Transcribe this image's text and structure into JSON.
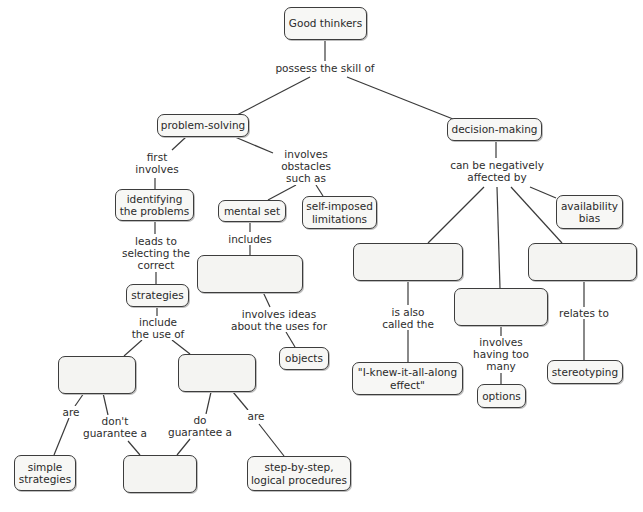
{
  "diagram": {
    "type": "concept-map",
    "nodes": {
      "root": "Good thinkers",
      "problem_solving": "problem-solving",
      "decision_making": "decision-making",
      "identifying": "identifying\nthe problems",
      "mental_set": "mental set",
      "self_imposed": "self-imposed\nlimitations",
      "blank_mental_child": "",
      "strategies": "strategies",
      "objects": "objects",
      "blank_strategy_left": "",
      "blank_strategy_right": "",
      "simple_strategies": "simple\nstrategies",
      "blank_solution": "",
      "step_by_step": "step-by-step,\nlogical procedures",
      "availability_bias": "availability\nbias",
      "blank_decision_left": "",
      "blank_decision_middle": "",
      "blank_decision_right": "",
      "i_knew": "\"I-knew-it-all-along\neffect\"",
      "options": "options",
      "stereotyping": "stereotyping"
    },
    "links": {
      "possess": "possess the skill of",
      "first_involves": "first\ninvolves",
      "obstacles": "involves\nobstacles\nsuch as",
      "leads_to": "leads to\nselecting the\ncorrect",
      "includes": "includes",
      "ideas": "involves ideas\nabout the uses for",
      "include_use": "include\nthe use of",
      "are_left": "are",
      "dont_guarantee": "don't\nguarantee a",
      "do_guarantee": "do\nguarantee a",
      "are_right": "are",
      "negatively": "can be negatively\naffected by",
      "also_called": "is also\ncalled the",
      "too_many": "involves\nhaving too\nmany",
      "relates_to": "relates to"
    }
  }
}
